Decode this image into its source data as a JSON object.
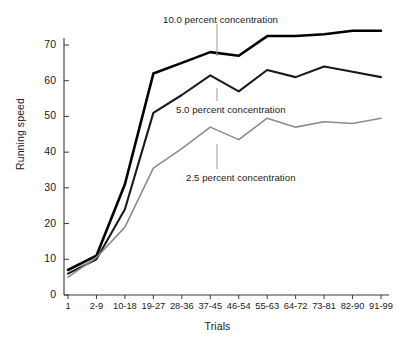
{
  "chart_data": {
    "type": "line",
    "title": "",
    "xlabel": "Trials",
    "ylabel": "Running speed",
    "categories": [
      "1",
      "2-9",
      "10-18",
      "19-27",
      "28-36",
      "37-45",
      "46-54",
      "55-63",
      "64-72",
      "73-81",
      "82-90",
      "91-99"
    ],
    "ylim": [
      0,
      76
    ],
    "yticks": [
      0,
      10,
      20,
      30,
      40,
      50,
      60,
      70
    ],
    "ytick_labels": [
      "0",
      "10",
      "20",
      "30",
      "40",
      "50",
      "60",
      "70"
    ],
    "grid": false,
    "legend_position": "inline-annotations",
    "series": [
      {
        "name": "10.0 percent concentration",
        "color": "#000000",
        "width": 2.6,
        "values": [
          7,
          11,
          31,
          62,
          65,
          68,
          67,
          72.5,
          72.5,
          73,
          74,
          74
        ]
      },
      {
        "name": "5.0 percent concentration",
        "color": "#1a1a1a",
        "width": 2.1,
        "values": [
          6,
          10,
          24,
          51,
          56,
          61.5,
          57,
          63,
          61,
          64,
          62.5,
          61
        ]
      },
      {
        "name": "2.5 percent concentration",
        "color": "#8c8c8c",
        "width": 1.6,
        "values": [
          5,
          10.5,
          19,
          35.5,
          41,
          47,
          43.5,
          49.5,
          47,
          48.5,
          48,
          49.5
        ]
      }
    ],
    "annotations": [
      {
        "label": "10.0 percent concentration",
        "text_x": 163,
        "text_y": 14,
        "leader_x": 217,
        "leader_y0": 24,
        "leader_y1": 56
      },
      {
        "label": "5.0 percent concentration",
        "text_x": 176,
        "text_y": 104,
        "leader_x": 217,
        "leader_y0": 88,
        "leader_y1": 101
      },
      {
        "label": "2.5 percent concentration",
        "text_x": 186,
        "text_y": 172,
        "leader_x": 217,
        "leader_y0": 144,
        "leader_y1": 169
      }
    ],
    "axis_color": "#3a3a3a"
  }
}
